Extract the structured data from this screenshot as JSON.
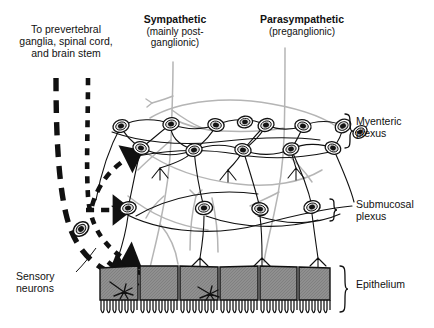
{
  "figure": {
    "title_alt": "Enteric nervous system: myenteric and submucosal plexuses with sympathetic, parasympathetic and sensory innervation of gut epithelium",
    "background": "#ffffff"
  },
  "labels": {
    "prevertebral": {
      "line1": "To prevertebral",
      "line2": "ganglia, spinal cord,",
      "line3": "and brain stem"
    },
    "sympathetic": {
      "title": "Sympathetic",
      "line2": "(mainly post-",
      "line3": "ganglionic)"
    },
    "parasympathetic": {
      "title": "Parasympathetic",
      "line2": "(preganglionic)"
    },
    "myenteric": {
      "line1": "Myenteric",
      "line2": "plexus"
    },
    "submucosal": {
      "line1": "Submucosal",
      "line2": "plexus"
    },
    "epithelium": {
      "line1": "Epithelium"
    },
    "sensory": {
      "line1": "Sensory",
      "line2": "neurons"
    }
  },
  "colors": {
    "ink": "#111111",
    "autonomic_fiber": "#b3b3b3",
    "epithelium_fill": "#8c8c8c",
    "epithelium_stroke": "#111111",
    "neuron_body": "#ffffff",
    "neuron_nucleus": "#1a1a1a",
    "background": "#ffffff"
  },
  "counts": {
    "myenteric_neurons": 13,
    "submucosal_neurons": 5,
    "epithelial_cells": 7,
    "sensory_endings_in_epithelium": 2,
    "ascending_sensory_tracts": 2
  },
  "structure": {
    "myenteric_row_top_y": 124,
    "myenteric_row_bottom_y": 146,
    "submucosal_row_y": 210,
    "epithelium_top_y": 266,
    "epithelium_bottom_y": 300
  }
}
